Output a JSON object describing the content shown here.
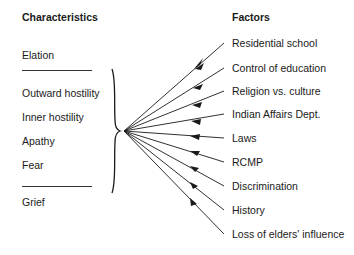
{
  "headers": {
    "characteristics": "Characteristics",
    "factors": "Factors"
  },
  "characteristics": {
    "top": "Elation",
    "grouped": [
      "Outward hostility",
      "Inner hostility",
      "Apathy",
      "Fear"
    ],
    "bottom": "Grief"
  },
  "factors": [
    "Residential school",
    "Control of education",
    "Religion vs. culture",
    "Indian Affairs Dept.",
    "Laws",
    "RCMP",
    "Discrimination",
    "History",
    "Loss of elders' influence"
  ],
  "colors": {
    "line": "#1a1a1a",
    "text": "#1a1a1a"
  }
}
